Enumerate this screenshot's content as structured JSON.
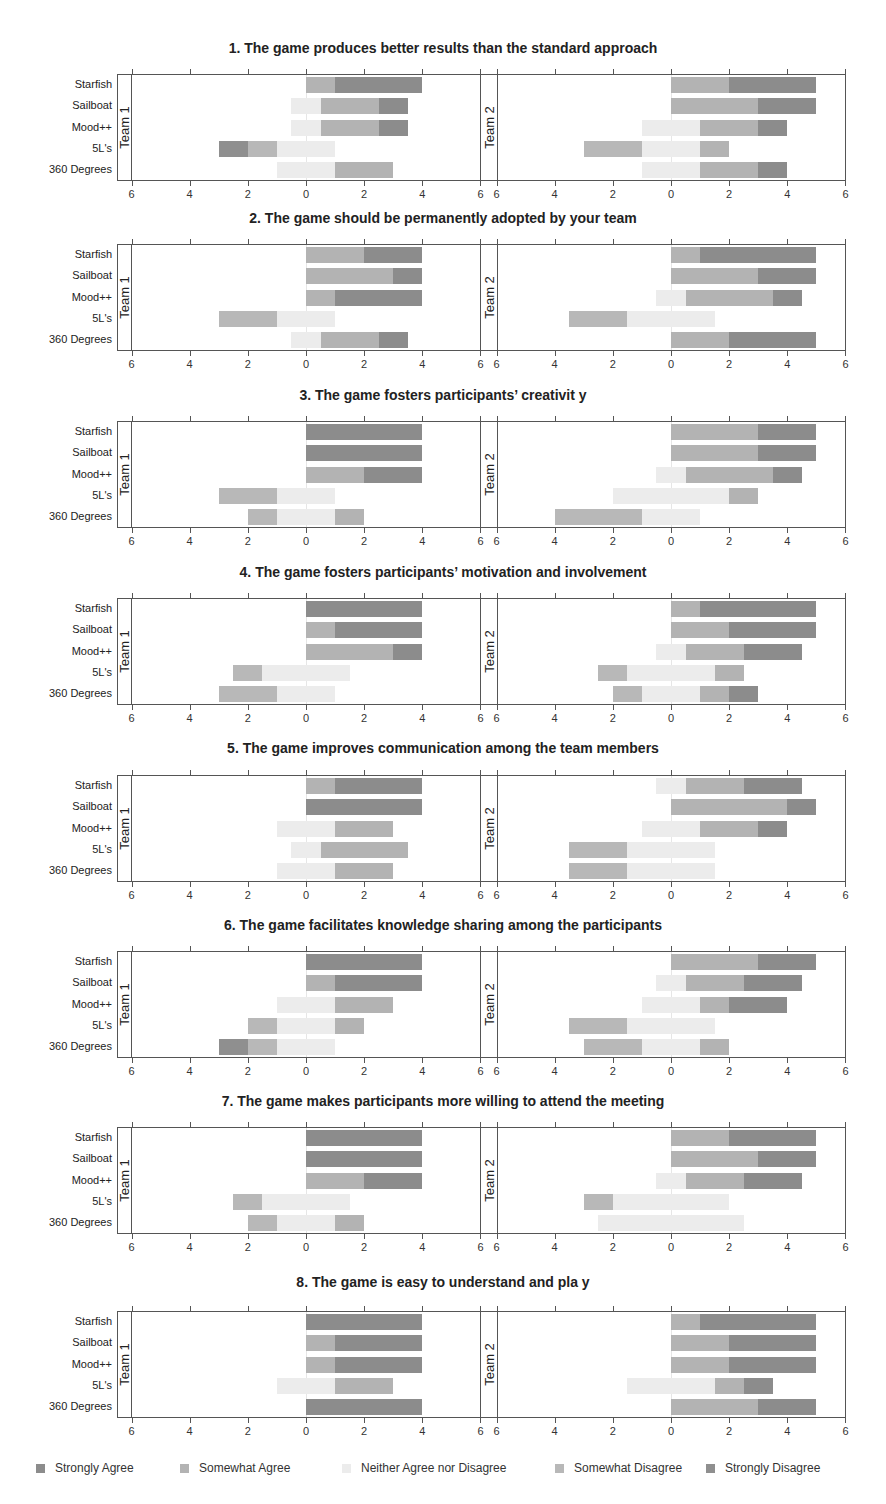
{
  "chart_data": {
    "type": "bar",
    "subtype": "diverging-stacked-likert",
    "categories": [
      "Starfish",
      "Sailboat",
      "Mood++",
      "5L's",
      "360 Degrees"
    ],
    "facets": [
      "Team 1",
      "Team 2"
    ],
    "response_levels": [
      "Strongly Disagree",
      "Somewhat Disagree",
      "Neither Agree nor Disagree",
      "Somewhat Agree",
      "Strongly Agree"
    ],
    "xlim": [
      -6,
      6
    ],
    "xticks": [
      6,
      4,
      2,
      0,
      2,
      4,
      6
    ],
    "grid": false,
    "legend_position": "bottom",
    "legend": [
      {
        "label": "Strongly Agree",
        "color": "#8c8c8c"
      },
      {
        "label": "Somewhat Agree",
        "color": "#b3b3b3"
      },
      {
        "label": "Neither Agree nor Disagree",
        "color": "#ececec"
      },
      {
        "label": "Somewhat  Disagree",
        "color": "#b8b8b8"
      },
      {
        "label": "Strongly Disagree",
        "color": "#8f8f8f"
      }
    ],
    "colors": {
      "strongly_disagree": "#8f8f8f",
      "somewhat_disagree": "#b8b8b8",
      "neutral": "#ececec",
      "somewhat_agree": "#b3b3b3",
      "strongly_agree": "#8c8c8c"
    },
    "value_order": "counts per category as [strongly_disagree, somewhat_disagree, neutral, somewhat_agree, strongly_agree]; neutral is centered on 0",
    "panels": [
      {
        "title": "1. The game produces better results than the standard approach",
        "team1": [
          [
            0,
            0,
            0,
            1,
            3
          ],
          [
            0,
            0,
            1,
            2,
            1
          ],
          [
            0,
            0,
            1,
            2,
            1
          ],
          [
            1,
            1,
            2,
            0,
            0
          ],
          [
            0,
            0,
            2,
            2,
            0
          ]
        ],
        "team2": [
          [
            0,
            0,
            0,
            2,
            3
          ],
          [
            0,
            0,
            0,
            3,
            2
          ],
          [
            0,
            0,
            2,
            2,
            1
          ],
          [
            0,
            2,
            2,
            1,
            0
          ],
          [
            0,
            0,
            2,
            2,
            1
          ]
        ]
      },
      {
        "title": "2. The game should be permanently adopted by your team",
        "team1": [
          [
            0,
            0,
            0,
            2,
            2
          ],
          [
            0,
            0,
            0,
            3,
            1
          ],
          [
            0,
            0,
            0,
            1,
            3
          ],
          [
            0,
            2,
            2,
            0,
            0
          ],
          [
            0,
            0,
            1,
            2,
            1
          ]
        ],
        "team2": [
          [
            0,
            0,
            0,
            1,
            4
          ],
          [
            0,
            0,
            0,
            3,
            2
          ],
          [
            0,
            0,
            1,
            3,
            1
          ],
          [
            0,
            2,
            3,
            0,
            0
          ],
          [
            0,
            0,
            0,
            2,
            3
          ]
        ]
      },
      {
        "title": "3. The game fosters participants’ creativit y",
        "team1": [
          [
            0,
            0,
            0,
            0,
            4
          ],
          [
            0,
            0,
            0,
            0,
            4
          ],
          [
            0,
            0,
            0,
            2,
            2
          ],
          [
            0,
            2,
            2,
            0,
            0
          ],
          [
            0,
            1,
            2,
            1,
            0
          ]
        ],
        "team2": [
          [
            0,
            0,
            0,
            3,
            2
          ],
          [
            0,
            0,
            0,
            3,
            2
          ],
          [
            0,
            0,
            1,
            3,
            1
          ],
          [
            0,
            0,
            4,
            1,
            0
          ],
          [
            0,
            3,
            2,
            0,
            0
          ]
        ]
      },
      {
        "title": "4. The game fosters participants’ motivation and involvement",
        "team1": [
          [
            0,
            0,
            0,
            0,
            4
          ],
          [
            0,
            0,
            0,
            1,
            3
          ],
          [
            0,
            0,
            0,
            3,
            1
          ],
          [
            0,
            1,
            3,
            0,
            0
          ],
          [
            0,
            2,
            2,
            0,
            0
          ]
        ],
        "team2": [
          [
            0,
            0,
            0,
            1,
            4
          ],
          [
            0,
            0,
            0,
            2,
            3
          ],
          [
            0,
            0,
            1,
            2,
            2
          ],
          [
            0,
            1,
            3,
            1,
            0
          ],
          [
            0,
            1,
            2,
            1,
            1
          ]
        ]
      },
      {
        "title": "5. The game improves communication among the team members",
        "team1": [
          [
            0,
            0,
            0,
            1,
            3
          ],
          [
            0,
            0,
            0,
            0,
            4
          ],
          [
            0,
            0,
            2,
            2,
            0
          ],
          [
            0,
            0,
            1,
            3,
            0
          ],
          [
            0,
            0,
            2,
            2,
            0
          ]
        ],
        "team2": [
          [
            0,
            0,
            1,
            2,
            2
          ],
          [
            0,
            0,
            0,
            4,
            1
          ],
          [
            0,
            0,
            2,
            2,
            1
          ],
          [
            0,
            2,
            3,
            0,
            0
          ],
          [
            0,
            2,
            3,
            0,
            0
          ]
        ]
      },
      {
        "title": "6. The game facilitates knowledge sharing among the participants",
        "team1": [
          [
            0,
            0,
            0,
            0,
            4
          ],
          [
            0,
            0,
            0,
            1,
            3
          ],
          [
            0,
            0,
            2,
            2,
            0
          ],
          [
            0,
            1,
            2,
            1,
            0
          ],
          [
            1,
            1,
            2,
            0,
            0
          ]
        ],
        "team2": [
          [
            0,
            0,
            0,
            3,
            2
          ],
          [
            0,
            0,
            1,
            2,
            2
          ],
          [
            0,
            0,
            2,
            1,
            2
          ],
          [
            0,
            2,
            3,
            0,
            0
          ],
          [
            0,
            2,
            2,
            1,
            0
          ]
        ]
      },
      {
        "title": "7. The game makes participants more willing to attend the meeting",
        "team1": [
          [
            0,
            0,
            0,
            0,
            4
          ],
          [
            0,
            0,
            0,
            0,
            4
          ],
          [
            0,
            0,
            0,
            2,
            2
          ],
          [
            0,
            1,
            3,
            0,
            0
          ],
          [
            0,
            1,
            2,
            1,
            0
          ]
        ],
        "team2": [
          [
            0,
            0,
            0,
            2,
            3
          ],
          [
            0,
            0,
            0,
            3,
            2
          ],
          [
            0,
            0,
            1,
            2,
            2
          ],
          [
            0,
            1,
            4,
            0,
            0
          ],
          [
            0,
            0,
            5,
            0,
            0
          ]
        ]
      },
      {
        "title": "8. The game is easy to understand and pla y",
        "team1": [
          [
            0,
            0,
            0,
            0,
            4
          ],
          [
            0,
            0,
            0,
            1,
            3
          ],
          [
            0,
            0,
            0,
            1,
            3
          ],
          [
            0,
            0,
            2,
            2,
            0
          ],
          [
            0,
            0,
            0,
            0,
            4
          ]
        ],
        "team2": [
          [
            0,
            0,
            0,
            1,
            4
          ],
          [
            0,
            0,
            0,
            2,
            3
          ],
          [
            0,
            0,
            0,
            2,
            3
          ],
          [
            0,
            0,
            3,
            1,
            1
          ],
          [
            0,
            0,
            0,
            3,
            2
          ]
        ]
      }
    ]
  }
}
